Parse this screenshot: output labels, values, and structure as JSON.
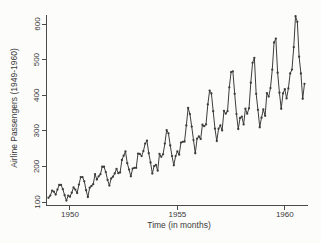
{
  "figure": {
    "background": "#fcfcfa",
    "line_color": "#3d3d3d",
    "marker_color": "#3d3d3d",
    "axis_color": "#4a4a4a",
    "text_color": "#3a3a3a"
  },
  "chart_data": {
    "type": "line",
    "title": "",
    "xlabel": "Time (in months)",
    "ylabel": "Airline Passengers (1949-1960)",
    "x_start_year": 1949,
    "x_step_months": 1,
    "x_ticks": [
      1950,
      1955,
      1960
    ],
    "y_ticks": [
      100,
      200,
      300,
      400,
      500,
      600
    ],
    "xlim": [
      1949.0,
      1960.917
    ],
    "ylim": [
      100,
      600
    ],
    "grid": false,
    "legend": "none",
    "marker": "small-filled-dot",
    "series": [
      {
        "name": "Airline Passengers",
        "values": [
          112,
          118,
          132,
          129,
          121,
          135,
          148,
          148,
          136,
          119,
          104,
          118,
          115,
          126,
          141,
          135,
          125,
          149,
          170,
          170,
          158,
          133,
          114,
          140,
          145,
          150,
          178,
          163,
          172,
          178,
          199,
          199,
          184,
          162,
          146,
          166,
          171,
          180,
          193,
          181,
          183,
          218,
          230,
          242,
          209,
          191,
          172,
          194,
          196,
          196,
          236,
          235,
          229,
          243,
          264,
          272,
          237,
          211,
          180,
          201,
          204,
          188,
          235,
          227,
          234,
          264,
          302,
          293,
          259,
          229,
          203,
          229,
          242,
          233,
          267,
          269,
          270,
          315,
          364,
          347,
          312,
          274,
          237,
          278,
          284,
          277,
          317,
          313,
          318,
          374,
          413,
          405,
          355,
          306,
          271,
          306,
          315,
          301,
          356,
          348,
          355,
          422,
          465,
          467,
          404,
          347,
          305,
          336,
          340,
          318,
          362,
          348,
          363,
          435,
          491,
          505,
          404,
          359,
          310,
          337,
          360,
          342,
          406,
          396,
          420,
          472,
          548,
          559,
          463,
          407,
          362,
          405,
          417,
          391,
          419,
          461,
          472,
          535,
          622,
          606,
          508,
          461,
          390,
          432
        ]
      }
    ]
  }
}
